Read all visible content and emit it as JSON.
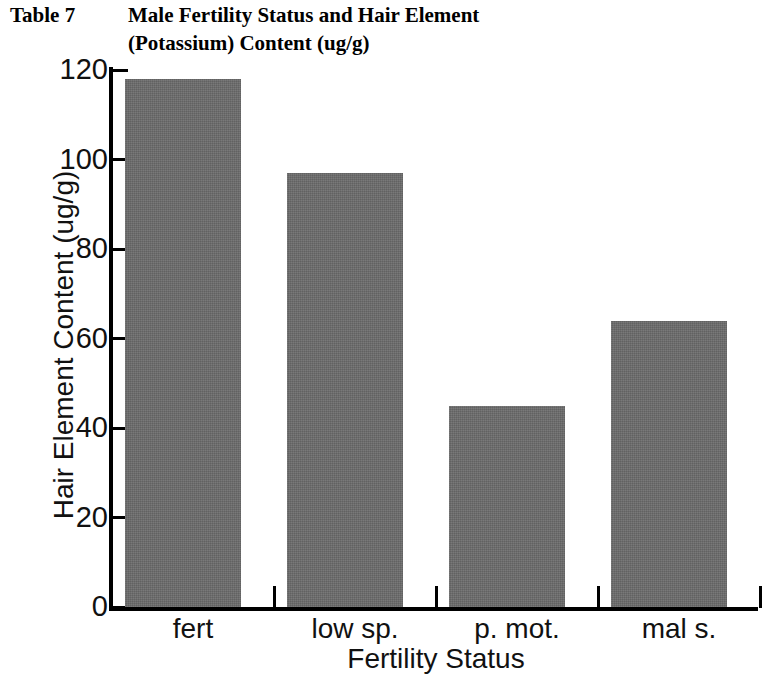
{
  "title": {
    "table_number": "Table 7",
    "line_1": "Male Fertility Status and Hair Element",
    "line_2": "(Potassium) Content (ug/g)"
  },
  "chart_data": {
    "type": "bar",
    "title": "Male Fertility Status and Hair Element (Potassium) Content (ug/g)",
    "categories": [
      "fert",
      "low sp.",
      "p. mot.",
      "mal s."
    ],
    "values": [
      118,
      97,
      45,
      64
    ],
    "xlabel": "Fertility Status",
    "ylabel": "Hair Element Content (ug/g)",
    "ylim": [
      0,
      120
    ],
    "ytick_labels": [
      "0",
      "20",
      "40",
      "60",
      "80",
      "100",
      "120"
    ],
    "ytick_values": [
      0,
      20,
      40,
      60,
      80,
      100,
      120
    ],
    "grid": false,
    "legend": false,
    "bar_color": "#6b6b6b",
    "axis_color": "#000000"
  }
}
